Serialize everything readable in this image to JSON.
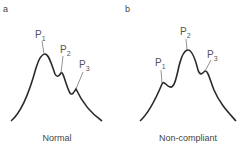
{
  "panels": [
    {
      "letter": "a",
      "caption": "Normal",
      "peaks": [
        {
          "label": "P",
          "sub": "1"
        },
        {
          "label": "P",
          "sub": "2"
        },
        {
          "label": "P",
          "sub": "3"
        }
      ]
    },
    {
      "letter": "b",
      "caption": "Non-compliant",
      "peaks": [
        {
          "label": "P",
          "sub": "1"
        },
        {
          "label": "P",
          "sub": "2"
        },
        {
          "label": "P",
          "sub": "3"
        }
      ]
    }
  ],
  "colors": {
    "curve": "#2b2b2b",
    "leader": "#777777",
    "text": "#444444"
  }
}
